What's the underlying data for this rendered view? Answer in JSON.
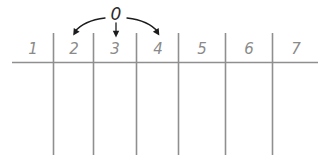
{
  "diagram": {
    "background_color": "#ffffff",
    "line_color": "#8f8f8f",
    "label_color": "#8a8a8a",
    "arrow_color": "#1c1c1c",
    "source_value": "0",
    "cells": [
      {
        "label": "1"
      },
      {
        "label": "2"
      },
      {
        "label": "3"
      },
      {
        "label": "4"
      },
      {
        "label": "5"
      },
      {
        "label": "6"
      },
      {
        "label": "7"
      }
    ],
    "arrows": [
      {
        "name": "arrow-to-2",
        "target": "2",
        "shape": "curve-left"
      },
      {
        "name": "arrow-to-3",
        "target": "3",
        "shape": "straight-down"
      },
      {
        "name": "arrow-to-4",
        "target": "4",
        "shape": "curve-right"
      }
    ]
  }
}
